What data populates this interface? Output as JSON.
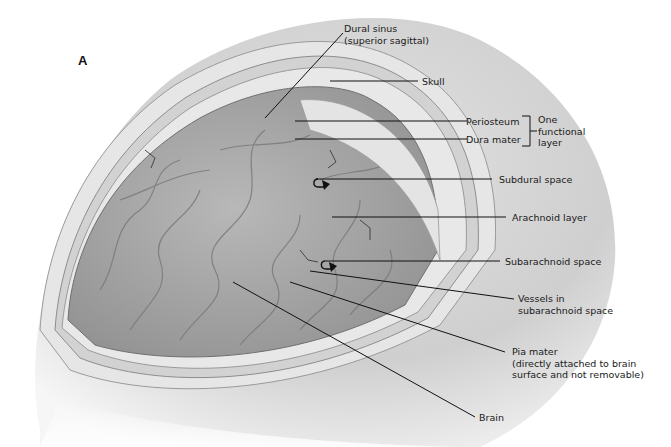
{
  "figure": {
    "panel_label": "A",
    "labels": {
      "dural_sinus": "Dural sinus\n(superior sagittal)",
      "skull": "Skull",
      "periosteum": "Periosteum",
      "dura_mater": "Dura mater",
      "one_functional_layer": "One\nfunctional\nlayer",
      "subdural_space": "Subdural space",
      "arachnoid_layer": "Arachnoid layer",
      "subarachnoid_space": "Subarachnoid space",
      "vessels": "Vessels in\nsubarachnoid space",
      "pia_mater": "Pia mater\n(directly attached to brain\nsurface and not removable)",
      "brain": "Brain"
    },
    "colors": {
      "skull": "#d6d6d6",
      "skull_shadow": "#bdbdbd",
      "dura": "#c9c9c9",
      "arachnoid": "#dcdcdc",
      "brain": "#a9a9a9",
      "leader_lines": "#111111"
    }
  }
}
